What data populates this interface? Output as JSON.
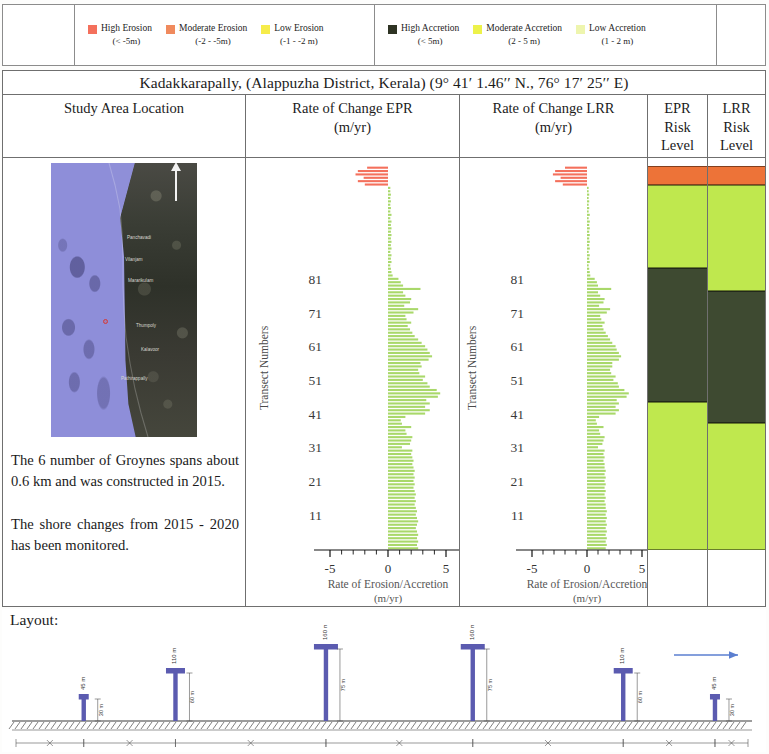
{
  "legend": {
    "erosion_items": [
      {
        "label": "High Erosion",
        "range": "(< -5m)",
        "color": "#F4705C",
        "icon": "legend-swatch-high-erosion"
      },
      {
        "label": "Moderate Erosion",
        "range": "(-2 - -5m)",
        "color": "#F08A5D",
        "icon": "legend-swatch-moderate-erosion"
      },
      {
        "label": "Low Erosion",
        "range": "(-1 - -2 m)",
        "color": "#F6EC4A",
        "icon": "legend-swatch-low-erosion"
      }
    ],
    "accretion_items": [
      {
        "label": "High Accretion",
        "range": "(< 5m)",
        "color": "#2E3323",
        "icon": "legend-swatch-high-accretion"
      },
      {
        "label": "Moderate Accretion",
        "range": "(2 - 5 m)",
        "color": "#EDF24A",
        "icon": "legend-swatch-moderate-accretion"
      },
      {
        "label": "Low Accretion",
        "range": "(1 - 2 m)",
        "color": "#EEF5AE",
        "icon": "legend-swatch-low-accretion"
      }
    ]
  },
  "table": {
    "title": "Kadakkarapally, (Alappuzha District, Kerala) (9° 41′ 1.46′′ N., 76° 17′ 25′′ E)",
    "headers": {
      "study_area": "Study Area Location",
      "epr_line1": "Rate of Change EPR",
      "epr_line2": "(m/yr)",
      "lrr_line1": "Rate of Change LRR",
      "lrr_line2": "(m/yr)",
      "epr_risk": [
        "EPR",
        "Risk",
        "Level"
      ],
      "lrr_risk": [
        "LRR",
        "Risk",
        "Level"
      ]
    }
  },
  "study_area": {
    "note_1": "The 6 number of Groynes spans about 0.6 km and was constructed in 2015.",
    "note_2": "The shore changes from 2015 - 2020 has been monitored.",
    "map_places": [
      "Panchavadi",
      "Vilanjam",
      "Mararikulam",
      "Thumpoly",
      "Kalavoor",
      "Pathirappally"
    ],
    "north_label": "N"
  },
  "chart_data": [
    {
      "id": "epr",
      "type": "bar",
      "orientation": "horizontal",
      "title": "Rate of Change EPR (m/yr)",
      "xlabel": "Rate of Erosion/Accretion (m/yr)",
      "ylabel": "Transect Numbers",
      "xlim": [
        -5,
        5
      ],
      "ylim": [
        1,
        88
      ],
      "xticks": [
        -5,
        -4,
        -3,
        -2,
        -1,
        0,
        1,
        2,
        3,
        4,
        5
      ],
      "xticklabels": [
        "-5",
        "",
        "",
        "",
        "",
        "0",
        "",
        "",
        "",
        "",
        "5"
      ],
      "yticks": [
        11,
        21,
        31,
        41,
        51,
        61,
        71,
        81
      ],
      "yticklabels": [
        "11",
        "21",
        "31",
        "41",
        "51",
        "61",
        "71",
        "81"
      ],
      "grid": false,
      "legend": "none",
      "bar_colors": {
        "erosion": "#F4705C",
        "accretion": "#A9D86A"
      },
      "values": [
        2.6,
        2.5,
        2.6,
        2.5,
        2.6,
        2.5,
        2.4,
        2.5,
        2.6,
        2.5,
        2.4,
        2.5,
        2.4,
        2.3,
        2.4,
        2.3,
        2.4,
        2.3,
        2.2,
        2.3,
        2.2,
        2.3,
        2.2,
        2.3,
        2.2,
        2.1,
        2.2,
        2.1,
        2.0,
        2.1,
        1.2,
        1.9,
        2.0,
        2.1,
        1.6,
        1.5,
        2.0,
        1.2,
        1.1,
        1.5,
        3.2,
        3.6,
        3.2,
        3.6,
        3.3,
        4.3,
        4.5,
        4.2,
        3.6,
        3.4,
        3.0,
        3.2,
        2.7,
        2.6,
        2.9,
        2.8,
        3.5,
        3.8,
        3.6,
        3.4,
        3.2,
        2.9,
        2.6,
        2.3,
        2.1,
        1.9,
        1.7,
        2.0,
        1.6,
        1.5,
        2.2,
        2.6,
        1.4,
        1.9,
        2.0,
        1.5,
        1.3,
        2.8,
        1.3,
        1.1,
        0.9,
        0.4,
        0.3,
        0.25,
        0.2,
        0.3,
        0.25,
        0.3,
        0.2,
        0.3,
        0.25,
        0.3,
        0.25,
        0.3,
        0.25,
        0.3,
        0.25,
        0.3,
        0.2,
        0.3,
        0.2,
        0.25,
        0.2,
        0.25,
        0.2,
        0.25,
        0.2,
        0.2,
        -2.0,
        -2.6,
        -2.1,
        -2.8,
        -2.6,
        -1.8
      ]
    },
    {
      "id": "lrr",
      "type": "bar",
      "orientation": "horizontal",
      "title": "Rate of Change LRR (m/yr)",
      "xlabel": "Rate of Erosion/Accretion (m/yr)",
      "ylabel": "Transect Numbers",
      "xlim": [
        -5,
        5
      ],
      "ylim": [
        1,
        88
      ],
      "xticks": [
        -5,
        -4,
        -3,
        -2,
        -1,
        0,
        1,
        2,
        3,
        4,
        5
      ],
      "xticklabels": [
        "-5",
        "",
        "",
        "",
        "",
        "0",
        "",
        "",
        "",
        "",
        "5"
      ],
      "yticks": [
        11,
        21,
        31,
        41,
        51,
        61,
        71,
        81
      ],
      "yticklabels": [
        "11",
        "21",
        "31",
        "41",
        "51",
        "61",
        "71",
        "81"
      ],
      "grid": false,
      "legend": "none",
      "bar_colors": {
        "erosion": "#F4705C",
        "accretion": "#A9D86A"
      },
      "values": [
        1.7,
        1.8,
        1.7,
        1.8,
        1.7,
        1.8,
        1.7,
        1.8,
        1.7,
        1.8,
        1.7,
        1.8,
        1.7,
        1.7,
        1.6,
        1.7,
        1.6,
        1.7,
        1.6,
        1.7,
        1.6,
        1.7,
        1.6,
        1.7,
        1.6,
        1.6,
        1.5,
        1.6,
        1.5,
        1.6,
        1.0,
        1.4,
        1.5,
        1.6,
        1.2,
        1.1,
        1.5,
        0.9,
        0.8,
        1.1,
        2.6,
        2.9,
        2.6,
        2.9,
        2.7,
        3.6,
        3.8,
        3.4,
        2.9,
        2.8,
        2.4,
        2.6,
        2.2,
        2.1,
        2.3,
        2.3,
        2.9,
        3.1,
        2.9,
        2.7,
        2.6,
        2.3,
        2.1,
        1.9,
        1.7,
        1.5,
        1.4,
        1.6,
        1.3,
        1.2,
        1.8,
        2.1,
        1.1,
        1.5,
        1.6,
        1.2,
        1.0,
        2.2,
        1.0,
        0.9,
        0.7,
        0.3,
        0.25,
        0.2,
        0.15,
        0.25,
        0.2,
        0.25,
        0.15,
        0.25,
        0.2,
        0.25,
        0.2,
        0.25,
        0.2,
        0.25,
        0.2,
        0.25,
        0.15,
        0.25,
        0.15,
        0.2,
        0.15,
        0.2,
        0.15,
        0.2,
        0.15,
        0.15,
        -2.2,
        -2.9,
        -2.4,
        -3.1,
        -2.9,
        -2.0
      ]
    }
  ],
  "risk_levels": {
    "epr": [
      {
        "label": "Moderate Erosion",
        "color": "#ED7338",
        "start_pct": 0.0,
        "end_pct": 5.0
      },
      {
        "label": "Low Accretion",
        "color": "#BFE84E",
        "start_pct": 5.0,
        "end_pct": 26.5
      },
      {
        "label": "High Accretion",
        "color": "#3E4A31",
        "start_pct": 26.5,
        "end_pct": 61.5
      },
      {
        "label": "Low Accretion",
        "color": "#BFE84E",
        "start_pct": 61.5,
        "end_pct": 100.0
      }
    ],
    "lrr": [
      {
        "label": "Moderate Erosion",
        "color": "#ED7338",
        "start_pct": 0.0,
        "end_pct": 5.0
      },
      {
        "label": "Low Accretion",
        "color": "#BFE84E",
        "start_pct": 5.0,
        "end_pct": 32.5
      },
      {
        "label": "High Accretion",
        "color": "#3E4A31",
        "start_pct": 32.5,
        "end_pct": 67.0
      },
      {
        "label": "Low Accretion",
        "color": "#BFE84E",
        "start_pct": 67.0,
        "end_pct": 100.0
      }
    ]
  },
  "layout": {
    "label": "Layout:",
    "groyne_count": 6,
    "groynes": [
      {
        "x_pct": 9.5,
        "stem_h": 22,
        "cap_w": 10,
        "top_label": "45 m",
        "side_label": "30 m"
      },
      {
        "x_pct": 22.0,
        "stem_h": 48,
        "cap_w": 19,
        "top_label": "110 m",
        "side_label": "60 m"
      },
      {
        "x_pct": 42.5,
        "stem_h": 72,
        "cap_w": 24,
        "top_label": "160 m",
        "side_label": "75 m"
      },
      {
        "x_pct": 62.5,
        "stem_h": 72,
        "cap_w": 24,
        "top_label": "160 m",
        "side_label": "75 m"
      },
      {
        "x_pct": 83.0,
        "stem_h": 48,
        "cap_w": 19,
        "top_label": "110 m",
        "side_label": "60 m"
      },
      {
        "x_pct": 95.5,
        "stem_h": 22,
        "cap_w": 10,
        "top_label": "45 m",
        "side_label": "30 m"
      }
    ],
    "spacing_labels": [
      "75 m",
      "125 m",
      "150 m",
      "150 m",
      "125 m",
      "75 m"
    ],
    "direction_arrow": "right-arrow-icon"
  }
}
